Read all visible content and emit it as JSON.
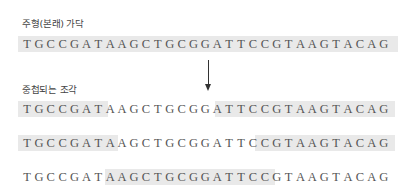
{
  "original_strand": {
    "label": "주형(본래) 가닥",
    "sequence": [
      "T",
      "G",
      "C",
      "C",
      "G",
      "A",
      "T",
      "A",
      "A",
      "G",
      "C",
      "T",
      "G",
      "C",
      "G",
      "G",
      "A",
      "T",
      "T",
      "C",
      "C",
      "G",
      "T",
      "A",
      "A",
      "G",
      "T",
      "A",
      "C",
      "A",
      "G"
    ]
  },
  "overlap_section": {
    "label": "중첩되는 조각",
    "rows": [
      {
        "sequence": [
          "T",
          "G",
          "C",
          "C",
          "G",
          "A",
          "T",
          "A",
          "A",
          "G",
          "C",
          "T",
          "G",
          "C",
          "G",
          "G",
          "A",
          "T",
          "T",
          "C",
          "C",
          "G",
          "T",
          "A",
          "A",
          "G",
          "T",
          "A",
          "C",
          "A",
          "G"
        ]
      },
      {
        "sequence": [
          "T",
          "G",
          "C",
          "C",
          "G",
          "A",
          "T",
          "A",
          "A",
          "G",
          "C",
          "T",
          "G",
          "C",
          "G",
          "G",
          "A",
          "T",
          "T",
          "C",
          "C",
          "G",
          "T",
          "A",
          "A",
          "G",
          "T",
          "A",
          "C",
          "A",
          "G"
        ]
      },
      {
        "sequence": [
          "T",
          "G",
          "C",
          "C",
          "G",
          "A",
          "T",
          "A",
          "A",
          "G",
          "C",
          "T",
          "G",
          "C",
          "G",
          "G",
          "A",
          "T",
          "T",
          "C",
          "C",
          "G",
          "T",
          "A",
          "A",
          "G",
          "T",
          "A",
          "C",
          "A",
          "G"
        ]
      }
    ]
  },
  "arrow": {
    "direction": "down"
  },
  "colors": {
    "text": "#555555",
    "highlight": "#e9e9e9",
    "arrow": "#333333"
  }
}
